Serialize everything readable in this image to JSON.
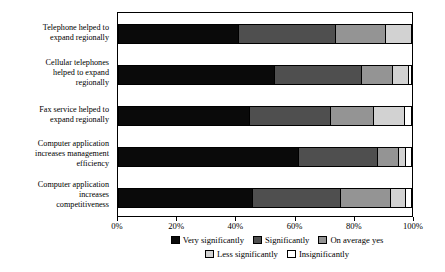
{
  "chart_data": {
    "type": "bar",
    "orientation": "horizontal",
    "stacked": true,
    "normalized": "percent",
    "title": "",
    "subtitle": "",
    "xlabel": "",
    "ylabel": "",
    "xlim": [
      0,
      100
    ],
    "grid": false,
    "legend_position": "bottom",
    "xticks": [
      "0%",
      "20%",
      "40%",
      "60%",
      "80%",
      "100%"
    ],
    "xtick_values": [
      0,
      20,
      40,
      60,
      80,
      100
    ],
    "categories": [
      "Telephone helped to expand regionally",
      "Cellular telephones helped to  expand regionally",
      "Fax service helped to expand regionally",
      "Computer application increases management efficiency",
      "Computer application increases competitiveness"
    ],
    "category_lines": [
      [
        "Telephone helped to",
        "expand regionally"
      ],
      [
        "Cellular telephones",
        "helped to  expand",
        "regionally"
      ],
      [
        "Fax service helped to",
        "expand regionally"
      ],
      [
        "Computer application",
        "increases management",
        "efficiency"
      ],
      [
        "Computer application",
        "increases",
        "competitiveness"
      ]
    ],
    "series": [
      {
        "name": "Very significantly",
        "color": "#0a0a0a",
        "values": [
          41.0,
          53.5,
          45.0,
          61.5,
          46.0
        ]
      },
      {
        "name": "Significantly",
        "color": "#4f4f4f",
        "values": [
          33.0,
          29.5,
          27.5,
          27.0,
          30.0
        ]
      },
      {
        "name": "On average yes",
        "color": "#949494",
        "values": [
          17.0,
          10.5,
          14.5,
          7.0,
          17.0
        ]
      },
      {
        "name": "Less significantly",
        "color": "#d2d2d2",
        "values": [
          9.0,
          5.5,
          10.5,
          2.5,
          5.0
        ]
      },
      {
        "name": "Insignificantly",
        "color": "#ffffff",
        "values": [
          0.0,
          1.0,
          2.5,
          2.0,
          2.0
        ]
      }
    ]
  },
  "legend": {
    "row1": [
      "Very significantly",
      "Significantly",
      "On average yes"
    ],
    "row2": [
      "Less significantly",
      "Insignificantly"
    ]
  }
}
